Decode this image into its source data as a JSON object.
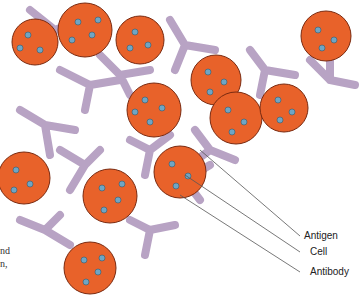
{
  "labels": {
    "antigen": "Antigen",
    "cell": "Cell",
    "antibody": "Antibody"
  },
  "caption_fragment": [
    "nd",
    "n,"
  ],
  "colors": {
    "cell": "#e8622a",
    "cell_outline": "#7a2a10",
    "antigen": "#6fa5c4",
    "antibody": "#b8a3c4",
    "antibody_outline": "#5a4a66",
    "leader": "#555555"
  },
  "cells": [
    {
      "cx": 35,
      "cy": 42,
      "r": 23
    },
    {
      "cx": 85,
      "cy": 30,
      "r": 27
    },
    {
      "cx": 140,
      "cy": 40,
      "r": 24
    },
    {
      "cx": 154,
      "cy": 110,
      "r": 27
    },
    {
      "cx": 216,
      "cy": 80,
      "r": 25
    },
    {
      "cx": 236,
      "cy": 118,
      "r": 26
    },
    {
      "cx": 284,
      "cy": 108,
      "r": 24
    },
    {
      "cx": 326,
      "cy": 36,
      "r": 25
    },
    {
      "cx": 24,
      "cy": 178,
      "r": 26
    },
    {
      "cx": 110,
      "cy": 196,
      "r": 27
    },
    {
      "cx": 180,
      "cy": 172,
      "r": 26
    },
    {
      "cx": 90,
      "cy": 268,
      "r": 26
    }
  ]
}
